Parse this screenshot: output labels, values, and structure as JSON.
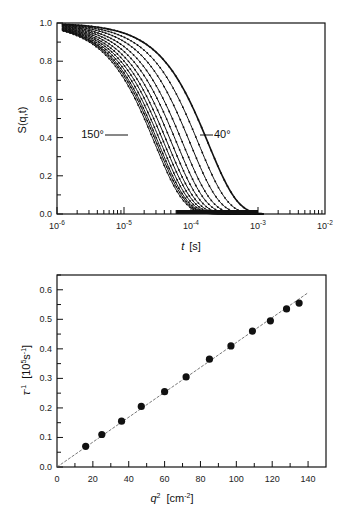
{
  "chart_data": [
    {
      "type": "line",
      "title": "",
      "xlabel": "t  [s]",
      "ylabel": "S(q,t)",
      "xscale": "log",
      "xlim": [
        1e-06,
        0.01
      ],
      "ylim": [
        0.0,
        1.0
      ],
      "x_tick_labels": [
        "10-6",
        "10-5",
        "10-4",
        "10-3",
        "10-2"
      ],
      "x_tick_exponents": [
        "-6",
        "-5",
        "-4",
        "-3",
        "-2"
      ],
      "y_tick_labels": [
        "0.0",
        "0.2",
        "0.4",
        "0.6",
        "0.8",
        "1.0"
      ],
      "grid": false,
      "legend": null,
      "annotations": [
        {
          "text": "150°",
          "target": "leftmost curve (highest angle)",
          "near": {
            "t": 2.2e-05,
            "S": 0.4
          }
        },
        {
          "text": "40°",
          "target": "rightmost curve (lowest angle)",
          "near": {
            "t": 0.00016,
            "S": 0.4
          }
        }
      ],
      "series_note": "Family of ~12 decay curves (data points with fitted lines) for scattering angles 40° to 150°; decay time decreases with increasing angle.",
      "series": [
        {
          "name": "40°",
          "tau": 0.000182,
          "beta": 1.0
        },
        {
          "name": "50°",
          "tau": 0.00013,
          "beta": 1.0
        },
        {
          "name": "60°",
          "tau": 9.8e-05,
          "beta": 1.0
        },
        {
          "name": "70°",
          "tau": 7.6e-05,
          "beta": 1.0
        },
        {
          "name": "80°",
          "tau": 6.2e-05,
          "beta": 1.0
        },
        {
          "name": "90°",
          "tau": 5.2e-05,
          "beta": 1.0
        },
        {
          "name": "100°",
          "tau": 4.5e-05,
          "beta": 1.0
        },
        {
          "name": "110°",
          "tau": 4e-05,
          "beta": 1.0
        },
        {
          "name": "120°",
          "tau": 3.6e-05,
          "beta": 1.0
        },
        {
          "name": "130°",
          "tau": 3.3e-05,
          "beta": 1.0
        },
        {
          "name": "140°",
          "tau": 3.1e-05,
          "beta": 1.0
        },
        {
          "name": "150°",
          "tau": 2.9e-05,
          "beta": 1.0
        }
      ]
    },
    {
      "type": "scatter",
      "title": "",
      "xlabel": "q² [cm⁻²]",
      "ylabel": "τ⁻¹ [10⁵s⁻¹]",
      "xlim": [
        0,
        150
      ],
      "ylim": [
        0.0,
        0.65
      ],
      "x_tick_labels": [
        "0",
        "20",
        "40",
        "60",
        "80",
        "100",
        "120",
        "140"
      ],
      "y_tick_labels": [
        "0.0",
        "0.1",
        "0.2",
        "0.3",
        "0.4",
        "0.5",
        "0.6"
      ],
      "grid": false,
      "legend": null,
      "x": [
        16,
        25,
        36,
        47,
        60,
        72,
        85,
        97,
        109,
        119,
        128,
        135
      ],
      "series": [
        {
          "name": "data",
          "values": [
            0.07,
            0.11,
            0.155,
            0.205,
            0.255,
            0.305,
            0.365,
            0.41,
            0.46,
            0.495,
            0.535,
            0.555
          ]
        }
      ],
      "fit_line": {
        "style": "dashed",
        "x": [
          0,
          140
        ],
        "y": [
          0.0,
          0.59
        ]
      }
    }
  ],
  "top_chart": {
    "ylabel": "S(q,t)",
    "xlabel_var": "t",
    "xlabel_unit": "[s]",
    "y_ticks": [
      "0.0",
      "0.2",
      "0.4",
      "0.6",
      "0.8",
      "1.0"
    ],
    "x_tick_base": "10",
    "x_tick_exps": [
      "-6",
      "-5",
      "-4",
      "-3",
      "-2"
    ],
    "annot_high": "150°",
    "annot_low": "40°"
  },
  "bottom_chart": {
    "ylabel_var": "τ",
    "ylabel_exp": "-1",
    "ylabel_unit_open": "[10",
    "ylabel_unit_exp": "5",
    "ylabel_unit_mid": "s",
    "ylabel_unit_exp2": "-1",
    "ylabel_unit_close": "]",
    "xlabel_var": "q",
    "xlabel_exp": "2",
    "xlabel_unit_open": "[cm",
    "xlabel_unit_exp": "-2",
    "xlabel_unit_close": "]",
    "y_ticks": [
      "0.0",
      "0.1",
      "0.2",
      "0.3",
      "0.4",
      "0.5",
      "0.6"
    ],
    "x_ticks": [
      "0",
      "20",
      "40",
      "60",
      "80",
      "100",
      "120",
      "140"
    ]
  },
  "colors": {
    "ink": "#111111",
    "fit_line": "#555555",
    "background": "#ffffff"
  }
}
